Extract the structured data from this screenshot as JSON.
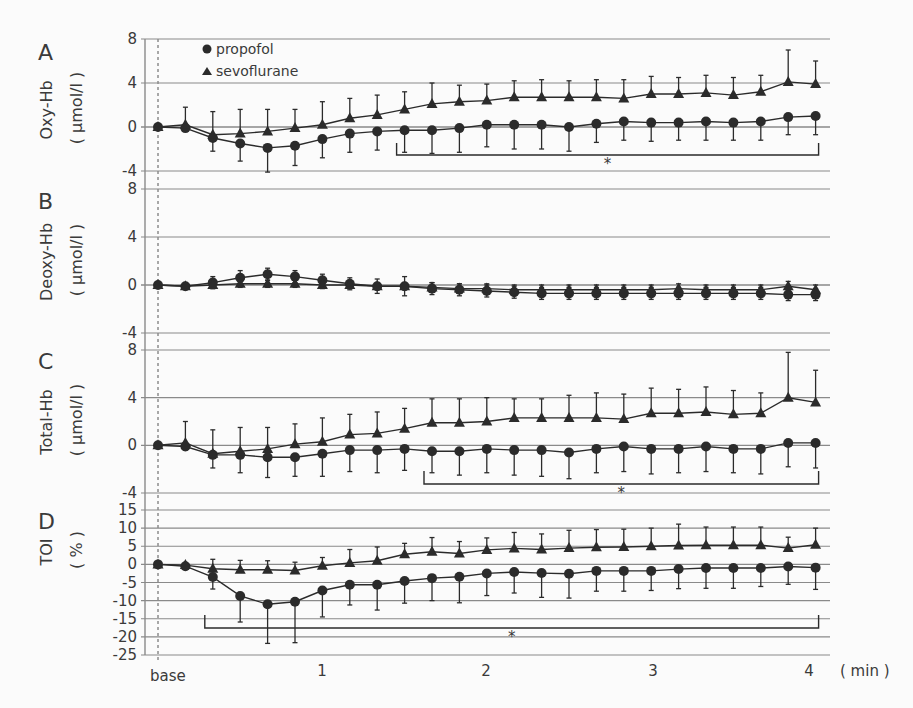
{
  "chart_data": [
    {
      "type": "line",
      "panel": "A",
      "ylabel": "Oxy-Hb",
      "yunit": "( µmol/l )",
      "ylim": [
        -4,
        8
      ],
      "yticks": [
        8,
        4,
        0,
        -4
      ],
      "x_seconds": [
        0,
        10,
        20,
        30,
        40,
        50,
        60,
        70,
        80,
        90,
        100,
        110,
        120,
        130,
        140,
        150,
        160,
        170,
        180,
        190,
        200,
        210,
        220,
        230,
        240
      ],
      "series": [
        {
          "name": "propofol",
          "marker": "circle",
          "values": [
            0,
            -0.1,
            -1.0,
            -1.5,
            -1.9,
            -1.7,
            -1.1,
            -0.6,
            -0.4,
            -0.3,
            -0.3,
            -0.1,
            0.2,
            0.2,
            0.2,
            0.0,
            0.3,
            0.5,
            0.4,
            0.4,
            0.5,
            0.4,
            0.5,
            0.9,
            1.0
          ],
          "err_low": [
            0,
            0.3,
            1.2,
            1.6,
            2.2,
            1.8,
            1.7,
            1.7,
            1.7,
            2.0,
            2.1,
            2.2,
            2.0,
            2.2,
            2.2,
            2.2,
            1.7,
            1.7,
            1.7,
            1.6,
            1.7,
            1.6,
            1.7,
            1.6,
            1.7
          ]
        },
        {
          "name": "sevoflurane",
          "marker": "triangle",
          "values": [
            0,
            0.2,
            -0.7,
            -0.6,
            -0.4,
            -0.1,
            0.2,
            0.8,
            1.1,
            1.6,
            2.1,
            2.3,
            2.4,
            2.7,
            2.7,
            2.7,
            2.7,
            2.6,
            3.0,
            3.0,
            3.1,
            2.9,
            3.2,
            4.1,
            3.9
          ],
          "err_high": [
            0,
            1.6,
            2.1,
            2.2,
            2.0,
            1.7,
            2.1,
            1.8,
            1.8,
            1.6,
            1.9,
            1.5,
            1.5,
            1.5,
            1.6,
            1.5,
            1.6,
            1.7,
            1.6,
            1.5,
            1.6,
            1.6,
            1.5,
            2.9,
            2.1
          ]
        }
      ],
      "annotations": [
        {
          "type": "bracket",
          "from_s": 90,
          "to_s": 240,
          "label": "*"
        }
      ]
    },
    {
      "type": "line",
      "panel": "B",
      "ylabel": "Deoxy-Hb",
      "yunit": "( µmol/l )",
      "ylim": [
        -4,
        8
      ],
      "yticks": [
        8,
        4,
        0,
        -4
      ],
      "x_seconds": [
        0,
        10,
        20,
        30,
        40,
        50,
        60,
        70,
        80,
        90,
        100,
        110,
        120,
        130,
        140,
        150,
        160,
        170,
        180,
        190,
        200,
        210,
        220,
        230,
        240
      ],
      "series": [
        {
          "name": "propofol",
          "marker": "circle",
          "values": [
            0,
            -0.1,
            0.2,
            0.6,
            0.9,
            0.7,
            0.4,
            0.1,
            -0.1,
            -0.1,
            -0.3,
            -0.4,
            -0.5,
            -0.6,
            -0.7,
            -0.7,
            -0.7,
            -0.7,
            -0.7,
            -0.7,
            -0.7,
            -0.7,
            -0.7,
            -0.8,
            -0.8
          ],
          "err": [
            0,
            0.1,
            0.5,
            0.6,
            0.5,
            0.5,
            0.5,
            0.5,
            0.6,
            0.8,
            0.5,
            0.5,
            0.5,
            0.5,
            0.5,
            0.5,
            0.5,
            0.5,
            0.5,
            0.5,
            0.5,
            0.5,
            0.5,
            0.5,
            0.5
          ]
        },
        {
          "name": "sevoflurane",
          "marker": "triangle",
          "values": [
            0,
            -0.1,
            0.0,
            0.1,
            0.1,
            0.1,
            0.0,
            0.0,
            -0.1,
            -0.1,
            -0.2,
            -0.3,
            -0.3,
            -0.4,
            -0.4,
            -0.4,
            -0.4,
            -0.4,
            -0.4,
            -0.3,
            -0.4,
            -0.4,
            -0.4,
            -0.1,
            -0.4
          ],
          "err": [
            0,
            0.1,
            0.3,
            0.3,
            0.3,
            0.3,
            0.3,
            0.3,
            0.3,
            0.3,
            0.4,
            0.4,
            0.4,
            0.4,
            0.4,
            0.4,
            0.4,
            0.4,
            0.4,
            0.4,
            0.4,
            0.4,
            0.4,
            0.4,
            0.4
          ]
        }
      ]
    },
    {
      "type": "line",
      "panel": "C",
      "ylabel": "Total-Hb",
      "yunit": "( µmol/l )",
      "ylim": [
        -4,
        8
      ],
      "yticks": [
        8,
        4,
        0,
        -4
      ],
      "x_seconds": [
        0,
        10,
        20,
        30,
        40,
        50,
        60,
        70,
        80,
        90,
        100,
        110,
        120,
        130,
        140,
        150,
        160,
        170,
        180,
        190,
        200,
        210,
        220,
        230,
        240
      ],
      "series": [
        {
          "name": "propofol",
          "marker": "circle",
          "values": [
            0,
            -0.1,
            -0.8,
            -0.8,
            -1.0,
            -1.0,
            -0.7,
            -0.4,
            -0.4,
            -0.3,
            -0.5,
            -0.5,
            -0.3,
            -0.4,
            -0.4,
            -0.6,
            -0.3,
            -0.1,
            -0.3,
            -0.3,
            -0.1,
            -0.3,
            -0.3,
            0.2,
            0.2
          ],
          "err_low": [
            0,
            0.3,
            1.1,
            1.5,
            1.7,
            1.6,
            1.9,
            1.8,
            1.9,
            1.8,
            1.8,
            2.0,
            2.0,
            2.1,
            2.2,
            2.2,
            2.0,
            2.1,
            2.1,
            2.0,
            2.1,
            2.0,
            2.1,
            2.0,
            2.1
          ]
        },
        {
          "name": "sevoflurane",
          "marker": "triangle",
          "values": [
            0,
            0.2,
            -0.7,
            -0.5,
            -0.3,
            0.1,
            0.3,
            0.9,
            1.0,
            1.4,
            1.9,
            1.9,
            2.0,
            2.3,
            2.3,
            2.3,
            2.3,
            2.2,
            2.7,
            2.7,
            2.8,
            2.6,
            2.7,
            4.0,
            3.6
          ],
          "err_high": [
            0,
            1.8,
            2.0,
            2.0,
            1.8,
            1.7,
            2.0,
            1.7,
            1.8,
            1.7,
            2.0,
            2.0,
            2.0,
            1.6,
            1.6,
            1.9,
            2.1,
            2.1,
            2.1,
            2.0,
            2.1,
            2.0,
            1.7,
            3.8,
            2.7
          ]
        }
      ],
      "annotations": [
        {
          "type": "bracket",
          "from_s": 100,
          "to_s": 240,
          "label": "*"
        }
      ]
    },
    {
      "type": "line",
      "panel": "D",
      "ylabel": "TOI",
      "yunit": "( % )",
      "ylim": [
        -25,
        15
      ],
      "yticks": [
        15,
        10,
        5,
        0,
        -5,
        -10,
        -15,
        -20,
        -25
      ],
      "x_seconds": [
        0,
        10,
        20,
        30,
        40,
        50,
        60,
        70,
        80,
        90,
        100,
        110,
        120,
        130,
        140,
        150,
        160,
        170,
        180,
        190,
        200,
        210,
        220,
        230,
        240
      ],
      "series": [
        {
          "name": "propofol",
          "marker": "circle",
          "values": [
            0,
            -0.5,
            -3.5,
            -8.7,
            -11.0,
            -10.3,
            -7.2,
            -5.6,
            -5.6,
            -4.6,
            -3.8,
            -3.4,
            -2.5,
            -2.1,
            -2.4,
            -2.6,
            -1.8,
            -1.8,
            -1.8,
            -1.3,
            -1.0,
            -1.0,
            -1.0,
            -0.6,
            -0.9,
            -0.2
          ],
          "err_low": [
            0,
            0.3,
            3.3,
            7.2,
            10.8,
            11.3,
            7.3,
            5.6,
            7.0,
            6.1,
            6.2,
            7.2,
            6.1,
            5.8,
            6.7,
            6.7,
            5.6,
            5.6,
            5.4,
            5.4,
            5.6,
            5.6,
            5.1,
            4.9,
            6.0,
            5.3
          ]
        },
        {
          "name": "sevoflurane",
          "marker": "triangle",
          "values": [
            0,
            -0.2,
            -1.2,
            -1.5,
            -1.5,
            -1.7,
            -0.4,
            0.4,
            1.0,
            2.8,
            3.5,
            3.0,
            4.0,
            4.4,
            4.1,
            4.5,
            4.7,
            4.8,
            5.0,
            5.2,
            5.3,
            5.3,
            5.3,
            4.5,
            5.4,
            5.0
          ],
          "err_high": [
            0,
            0.5,
            2.6,
            2.6,
            2.5,
            2.3,
            2.3,
            3.7,
            3.8,
            3.0,
            3.9,
            3.3,
            3.3,
            4.4,
            4.3,
            4.9,
            4.9,
            4.9,
            5.0,
            5.9,
            5.0,
            5.0,
            5.0,
            3.0,
            4.6,
            5.0
          ]
        }
      ],
      "annotations": [
        {
          "type": "bracket",
          "from_s": 20,
          "to_s": 240,
          "label": "*"
        }
      ]
    }
  ],
  "panels": [
    {
      "letter": "A",
      "ylabel": "Oxy-Hb",
      "yunit": "( µmol/l )"
    },
    {
      "letter": "B",
      "ylabel": "Deoxy-Hb",
      "yunit": "( µmol/l )"
    },
    {
      "letter": "C",
      "ylabel": "Total-Hb",
      "yunit": "( µmol/l )"
    },
    {
      "letter": "D",
      "ylabel": "TOI",
      "yunit": "( % )"
    }
  ],
  "legend": {
    "propofol": "propofol",
    "sevoflurane": "sevoflurane"
  },
  "xaxis": {
    "ticks": [
      "base",
      "1",
      "2",
      "3",
      "4"
    ],
    "unit": "( min )"
  },
  "significance_mark": "*"
}
